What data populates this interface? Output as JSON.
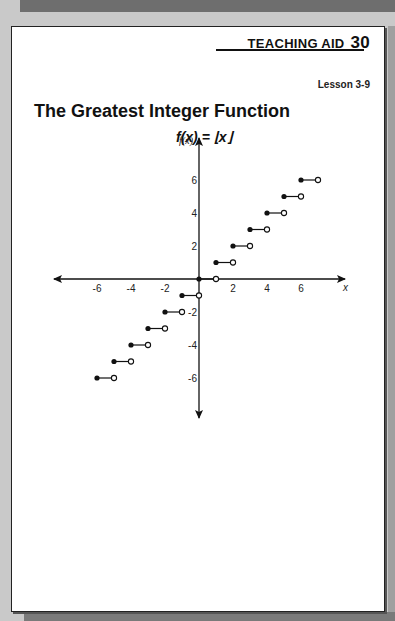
{
  "header": {
    "teaching_aid_label": "TEACHING AID",
    "teaching_aid_number": "30",
    "lesson": "Lesson 3-9"
  },
  "title": "The Greatest Integer Function",
  "formula": "f(x) = ⌊x⌋",
  "chart_data": {
    "type": "scatter",
    "title": "f(x) = ⌊x⌋",
    "xlabel": "x",
    "ylabel": "f(x)",
    "x_ticks": [
      "-6",
      "-4",
      "-2",
      "2",
      "4",
      "6"
    ],
    "y_ticks": [
      "6",
      "4",
      "2",
      "-2",
      "-4",
      "-6"
    ],
    "xlim": [
      -8.5,
      8.5
    ],
    "ylim": [
      -8,
      8
    ],
    "grid": false,
    "series": [
      {
        "name": "step segments",
        "segments": [
          {
            "x_start": -6,
            "x_end": -5,
            "y": -6,
            "closed_start": true,
            "open_end": true
          },
          {
            "x_start": -5,
            "x_end": -4,
            "y": -5,
            "closed_start": true,
            "open_end": true
          },
          {
            "x_start": -4,
            "x_end": -3,
            "y": -4,
            "closed_start": true,
            "open_end": true
          },
          {
            "x_start": -3,
            "x_end": -2,
            "y": -3,
            "closed_start": true,
            "open_end": true
          },
          {
            "x_start": -2,
            "x_end": -1,
            "y": -2,
            "closed_start": true,
            "open_end": true
          },
          {
            "x_start": -1,
            "x_end": 0,
            "y": -1,
            "closed_start": true,
            "open_end": true
          },
          {
            "x_start": 0,
            "x_end": 1,
            "y": 0,
            "closed_start": true,
            "open_end": true
          },
          {
            "x_start": 1,
            "x_end": 2,
            "y": 1,
            "closed_start": true,
            "open_end": true
          },
          {
            "x_start": 2,
            "x_end": 3,
            "y": 2,
            "closed_start": true,
            "open_end": true
          },
          {
            "x_start": 3,
            "x_end": 4,
            "y": 3,
            "closed_start": true,
            "open_end": true
          },
          {
            "x_start": 4,
            "x_end": 5,
            "y": 4,
            "closed_start": true,
            "open_end": true
          },
          {
            "x_start": 5,
            "x_end": 6,
            "y": 5,
            "closed_start": true,
            "open_end": true
          },
          {
            "x_start": 6,
            "x_end": 7,
            "y": 6,
            "closed_start": true,
            "open_end": true
          }
        ]
      }
    ]
  }
}
